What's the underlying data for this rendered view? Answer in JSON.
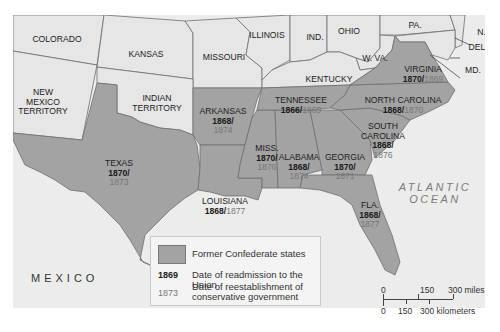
{
  "colors": {
    "background": "#ececec",
    "other_states": "#e6e6e6",
    "confederate_states": "#a3a3a3",
    "water": "#ececec",
    "border": "#6e6e6e",
    "readmission_year": "#1a1a1a",
    "conservative_year": "#777777"
  },
  "other_states": [
    {
      "id": "colorado",
      "label": "COLORADO"
    },
    {
      "id": "kansas",
      "label": "KANSAS"
    },
    {
      "id": "missouri",
      "label": "MISSOURI"
    },
    {
      "id": "illinois",
      "label": "ILLINOIS"
    },
    {
      "id": "indiana",
      "label": "IND."
    },
    {
      "id": "ohio",
      "label": "OHIO"
    },
    {
      "id": "pennsylvania",
      "label": "PA."
    },
    {
      "id": "new-jersey",
      "label": "N.J."
    },
    {
      "id": "delaware",
      "label": "DEL."
    },
    {
      "id": "maryland",
      "label": "MD."
    },
    {
      "id": "west-virginia",
      "label": "W. VA."
    },
    {
      "id": "kentucky",
      "label": "KENTUCKY"
    },
    {
      "id": "new-mexico",
      "label_lines": [
        "NEW",
        "MEXICO",
        "TERRITORY"
      ]
    },
    {
      "id": "indian-territory",
      "label_lines": [
        "INDIAN",
        "TERRITORY"
      ]
    }
  ],
  "confederate_states": [
    {
      "id": "texas",
      "label": "TEXAS",
      "readmitted": "1870/",
      "conservative": "1873"
    },
    {
      "id": "arkansas",
      "label": "ARKANSAS",
      "readmitted": "1868/",
      "conservative": "1874"
    },
    {
      "id": "louisiana",
      "label": "LOUISIANA",
      "readmitted": "1868/",
      "conservative": "1877"
    },
    {
      "id": "mississippi",
      "label": "MISS.",
      "readmitted": "1870/",
      "conservative": "1876"
    },
    {
      "id": "alabama",
      "label": "ALABAMA",
      "readmitted": "1868/",
      "conservative": "1874"
    },
    {
      "id": "georgia",
      "label": "GEORGIA",
      "readmitted": "1870/",
      "conservative": "1871"
    },
    {
      "id": "florida",
      "label": "FLA.",
      "readmitted": "1868/",
      "conservative": "1877"
    },
    {
      "id": "south-carolina",
      "label_lines": [
        "SOUTH",
        "CAROLINA"
      ],
      "readmitted": "1868/",
      "conservative": "1876"
    },
    {
      "id": "north-carolina",
      "label": "NORTH CAROLINA",
      "readmitted": "1868/",
      "conservative": "1870"
    },
    {
      "id": "tennessee",
      "label": "TENNESSEE",
      "readmitted": "1866/",
      "conservative": "1869"
    },
    {
      "id": "virginia",
      "label": "VIRGINIA",
      "readmitted": "1870/",
      "conservative": "1869"
    }
  ],
  "regions": {
    "ocean": [
      "ATLANTIC",
      "OCEAN"
    ],
    "country": "MEXICO"
  },
  "legend": {
    "swatch_label": "Former Confederate states",
    "readmission_sample": "1869",
    "readmission_label": "Date of readmission to the Union",
    "conservative_sample": "1873",
    "conservative_label_lines": [
      "Date of reestablishment of",
      "conservative government"
    ]
  },
  "scale": {
    "miles": [
      "0",
      "150",
      "300 miles"
    ],
    "kilometers": [
      "0",
      "150",
      "300 kilometers"
    ]
  }
}
